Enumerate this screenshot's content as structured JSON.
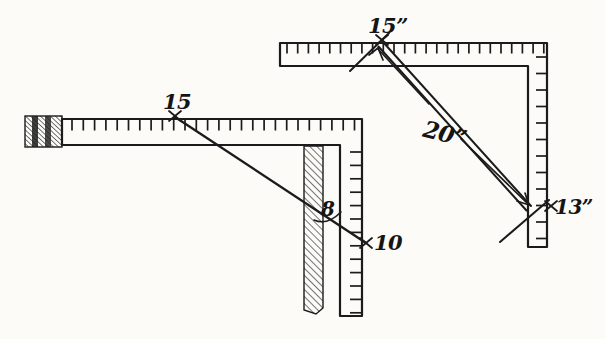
{
  "colors": {
    "ink": "#1b1b1b",
    "paper": "#fcfbf8"
  },
  "left_figure": {
    "blade_mark": "15",
    "board_mark": "8",
    "tongue_mark": "10"
  },
  "right_figure": {
    "blade_mark": "15”",
    "diagonal_dimension": "20”",
    "tongue_mark": "13”"
  }
}
